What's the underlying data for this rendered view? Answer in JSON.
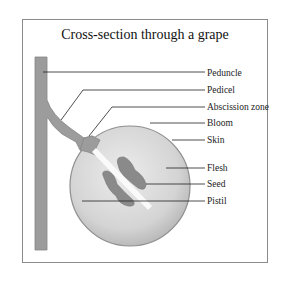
{
  "title": "Cross-section through a grape",
  "labels": [
    {
      "id": "peduncle",
      "text": "Peduncle",
      "y": 68
    },
    {
      "id": "pedicel",
      "text": "Pedicel",
      "y": 85
    },
    {
      "id": "abscission-zone",
      "text": "Abscission zone",
      "y": 102
    },
    {
      "id": "bloom",
      "text": "Bloom",
      "y": 118
    },
    {
      "id": "skin",
      "text": "Skin",
      "y": 135
    },
    {
      "id": "flesh",
      "text": "Flesh",
      "y": 163
    },
    {
      "id": "seed",
      "text": "Seed",
      "y": 179
    },
    {
      "id": "pistil",
      "text": "Pistil",
      "y": 196
    }
  ],
  "colors": {
    "stem": "#9a9a9a",
    "stem_outline": "#7a7a7a",
    "grape_light": "#e4e4e4",
    "grape_dark": "#b8b8b8",
    "seed": "#8c8c8c",
    "line": "#222222"
  }
}
